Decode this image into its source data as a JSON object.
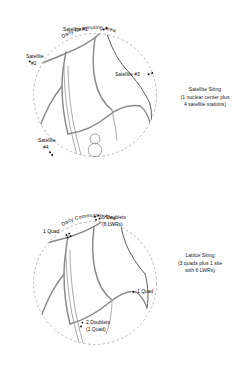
{
  "figure": {
    "panels": [
      {
        "id": "satellite-siting",
        "arc_title": "Daily Commuting Area",
        "caption": {
          "line1": "Satellite Siting",
          "line2": "(1 nuclear center plus",
          "line3": "4 satellite stations)"
        },
        "labels": [
          {
            "id": "satellite-1",
            "line1": "Satellite #1",
            "line2": "",
            "x": 63,
            "y": 31,
            "anchor": "start"
          },
          {
            "id": "satellite-2",
            "line1": "Satellite",
            "line2": "#2",
            "x": 26,
            "y": 58,
            "anchor": "start"
          },
          {
            "id": "satellite-3",
            "line1": "Satellite #3",
            "line2": "",
            "x": 115,
            "y": 76,
            "anchor": "start"
          },
          {
            "id": "satellite-4",
            "line1": "Satellite",
            "line2": "#4",
            "x": 38,
            "y": 142,
            "anchor": "start"
          }
        ],
        "site_dots": [
          {
            "id": "site-satellite-1",
            "x": 103.6,
            "y": 29.5,
            "r": 1.0
          },
          {
            "id": "site-satellite-1b",
            "x": 106.6,
            "y": 28.2,
            "r": 1.0
          },
          {
            "id": "site-satellite-2",
            "x": 29.8,
            "y": 61.4,
            "r": 1.0
          },
          {
            "id": "site-satellite-3",
            "x": 148.6,
            "y": 74.2,
            "r": 1.0
          },
          {
            "id": "site-satellite-3b",
            "x": 152.2,
            "y": 73.0,
            "r": 1.0
          },
          {
            "id": "site-satellite-4",
            "x": 50.0,
            "y": 152.2,
            "r": 1.0
          },
          {
            "id": "site-satellite-4b",
            "x": 52.2,
            "y": 155.0,
            "r": 1.0
          }
        ]
      },
      {
        "id": "lattice-siting",
        "arc_title": "Daily Commuting Area",
        "caption": {
          "line1": "Lattice Siting",
          "line2": "(3 quads plus 1 site",
          "line3": "with 6 LWRs)"
        },
        "labels": [
          {
            "id": "quad-upper-left",
            "line1": "1 Quad",
            "line2": "",
            "x": 43,
            "y": 233,
            "anchor": "start"
          },
          {
            "id": "doublets-three",
            "line1": "3 Doublets",
            "line2": "(6 LWRs)",
            "x": 102,
            "y": 219,
            "anchor": "start"
          },
          {
            "id": "quad-right",
            "line1": "1 Quad",
            "line2": "",
            "x": 137,
            "y": 293,
            "anchor": "start"
          },
          {
            "id": "doublets-two",
            "line1": "2 Doublets",
            "line2": "(1 Quad)",
            "x": 86,
            "y": 324,
            "anchor": "start"
          }
        ],
        "site_dots": [
          {
            "id": "lattice-quad-ul-a",
            "x": 66.4,
            "y": 235.0,
            "r": 0.95
          },
          {
            "id": "lattice-quad-ul-b",
            "x": 69.2,
            "y": 233.6,
            "r": 0.95
          },
          {
            "id": "lattice-quad-ul-c",
            "x": 67.6,
            "y": 237.6,
            "r": 0.95
          },
          {
            "id": "lattice-quad-ul-d",
            "x": 70.6,
            "y": 236.2,
            "r": 0.95
          },
          {
            "id": "lattice-doublet-a",
            "x": 95.0,
            "y": 216.8,
            "r": 0.95
          },
          {
            "id": "lattice-doublet-b",
            "x": 98.2,
            "y": 215.6,
            "r": 0.95
          },
          {
            "id": "lattice-doublet-c",
            "x": 96.0,
            "y": 219.8,
            "r": 0.95
          },
          {
            "id": "lattice-doublet-d",
            "x": 99.4,
            "y": 218.6,
            "r": 0.95
          },
          {
            "id": "lattice-quad-right",
            "x": 133.4,
            "y": 292.0,
            "r": 0.95
          },
          {
            "id": "lattice-doublets-two-a",
            "x": 82.4,
            "y": 322.6,
            "r": 0.95
          },
          {
            "id": "lattice-doublets-two-b",
            "x": 81.0,
            "y": 326.4,
            "r": 0.95
          }
        ]
      }
    ]
  }
}
